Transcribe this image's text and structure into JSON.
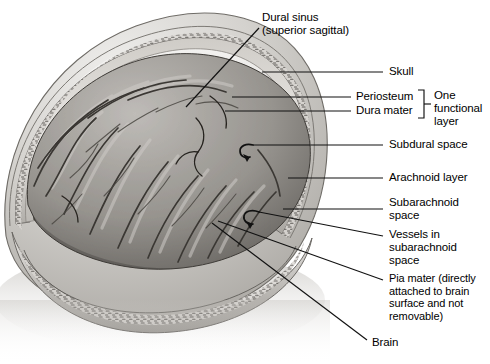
{
  "figure": {
    "title_visible": false,
    "type": "anatomical-illustration",
    "style": "grayscale medical drawing",
    "background_color": "#ffffff",
    "ink_color": "#000000"
  },
  "labels": [
    {
      "id": "dural-sinus",
      "lines": [
        "Dural sinus",
        "(superior sagittal)"
      ],
      "text_x": 262,
      "text_y": 13,
      "leader": {
        "type": "line",
        "points": [
          [
            259,
            28
          ],
          [
            186,
            107
          ]
        ]
      }
    },
    {
      "id": "skull",
      "lines": [
        "Skull"
      ],
      "text_x": 389,
      "text_y": 66,
      "leader": {
        "type": "line",
        "points": [
          [
            383,
            72
          ],
          [
            262,
            72
          ]
        ]
      }
    },
    {
      "id": "periosteum",
      "lines": [
        "Periosteum"
      ],
      "text_x": 356,
      "text_y": 91,
      "leader": {
        "type": "line",
        "points": [
          [
            351,
            97
          ],
          [
            232,
            97
          ]
        ]
      }
    },
    {
      "id": "dura-mater",
      "lines": [
        "Dura mater"
      ],
      "text_x": 356,
      "text_y": 105,
      "leader": {
        "type": "line",
        "points": [
          [
            351,
            111
          ],
          [
            225,
            111
          ]
        ]
      }
    },
    {
      "id": "one-functional-layer",
      "lines": [
        "One",
        "functional",
        "layer"
      ],
      "text_x": 434,
      "text_y": 90,
      "bracket": {
        "x": 424,
        "y_top": 90,
        "y_bottom": 118,
        "tip_x": 430,
        "tip_y": 104
      }
    },
    {
      "id": "subdural-space",
      "lines": [
        "Subdural space"
      ],
      "text_x": 389,
      "text_y": 139,
      "leader": {
        "type": "hook",
        "points": [
          [
            383,
            145
          ],
          [
            252,
            145
          ]
        ],
        "arrow_at": [
          246,
          149
        ]
      }
    },
    {
      "id": "arachnoid-layer",
      "lines": [
        "Arachnoid layer"
      ],
      "text_x": 389,
      "text_y": 172,
      "leader": {
        "type": "line",
        "points": [
          [
            383,
            178
          ],
          [
            288,
            178
          ]
        ]
      }
    },
    {
      "id": "subarachnoid-space",
      "lines": [
        "Subarachnoid",
        "space"
      ],
      "text_x": 389,
      "text_y": 198,
      "leader": {
        "type": "line",
        "points": [
          [
            383,
            209
          ],
          [
            283,
            209
          ]
        ]
      }
    },
    {
      "id": "vessels-in-subarachnoid-space",
      "lines": [
        "Vessels in",
        "subarachnoid",
        "space"
      ],
      "text_x": 389,
      "text_y": 229,
      "leader": {
        "type": "hook",
        "points": [
          [
            383,
            236
          ],
          [
            258,
            212
          ]
        ],
        "arrow_at": [
          252,
          208
        ]
      }
    },
    {
      "id": "pia-mater",
      "lines": [
        "Pia mater (directly",
        "attached to brain",
        "surface and not",
        "removable)"
      ],
      "text_x": 389,
      "text_y": 273,
      "leader": {
        "type": "line",
        "points": [
          [
            383,
            280
          ],
          [
            218,
            221
          ]
        ]
      }
    },
    {
      "id": "brain",
      "lines": [
        "Brain"
      ],
      "text_x": 372,
      "text_y": 337,
      "leader": {
        "type": "line",
        "points": [
          [
            367,
            340
          ],
          [
            212,
            223
          ]
        ]
      }
    }
  ],
  "illustration_parts": [
    {
      "name": "skull-outer-table",
      "description": "outer curved bone dome, light gray"
    },
    {
      "name": "diploe-cut-edge",
      "description": "speckled cancellous bone band at cut rim"
    },
    {
      "name": "periosteum-band",
      "description": "thin pale band under skull"
    },
    {
      "name": "dura-mater-band",
      "description": "darker fibrous band"
    },
    {
      "name": "subdural-space-gap",
      "description": "narrow gap below dura"
    },
    {
      "name": "arachnoid-layer-veil",
      "description": "translucent membrane over gyri"
    },
    {
      "name": "subarachnoid-space-gap",
      "description": "space containing vessels"
    },
    {
      "name": "superior-sagittal-sinus",
      "description": "triangular channel in dura at apex"
    },
    {
      "name": "cerebral-hemisphere",
      "description": "gyri and sulci of cortex"
    },
    {
      "name": "cortical-vessels",
      "description": "dark branching vessels on brain surface"
    }
  ],
  "palette": {
    "paper": "#ffffff",
    "bone_light": "#d8d6d2",
    "bone_mid": "#b9b6b1",
    "bone_dark": "#8e8b86",
    "dura": "#6f6d69",
    "brain_light": "#b2afab",
    "brain_mid": "#8b8884",
    "brain_dark": "#56534f",
    "line": "#111111"
  }
}
